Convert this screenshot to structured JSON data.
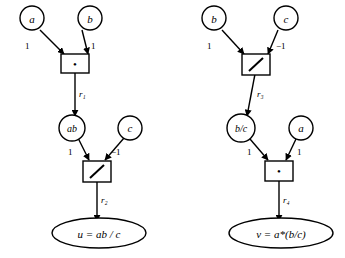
{
  "diagram": {
    "type": "computational-dataflow-graph",
    "title": "",
    "background_color": "#ffffff",
    "stroke_color": "#000000",
    "graphs": [
      {
        "id": "left-graph",
        "result": "u = ab / c",
        "nodes": [
          {
            "id": "a",
            "label": "a",
            "shape": "circle",
            "x": 30,
            "y": 18
          },
          {
            "id": "b",
            "label": "b",
            "shape": "circle",
            "x": 88,
            "y": 18
          },
          {
            "id": "mul1",
            "label": "•",
            "shape": "box",
            "x": 70,
            "y": 62
          },
          {
            "id": "ab",
            "label": "ab",
            "shape": "circle",
            "x": 70,
            "y": 128
          },
          {
            "id": "c1",
            "label": "c",
            "shape": "circle",
            "x": 128,
            "y": 128
          },
          {
            "id": "div1",
            "label": "/",
            "shape": "box",
            "x": 92,
            "y": 170
          },
          {
            "id": "u",
            "label": "u = ab / c",
            "shape": "ellipse",
            "x": 100,
            "y": 233
          }
        ],
        "edges": [
          {
            "from": "a",
            "to": "mul1",
            "weight": "1"
          },
          {
            "from": "b",
            "to": "mul1",
            "weight": "1"
          },
          {
            "from": "mul1",
            "to": "ab",
            "weight": "r₁"
          },
          {
            "from": "ab",
            "to": "div1",
            "weight": "1"
          },
          {
            "from": "c1",
            "to": "div1",
            "weight": "−1"
          },
          {
            "from": "div1",
            "to": "u",
            "weight": "r₂"
          }
        ]
      },
      {
        "id": "right-graph",
        "result": "v = a*(b/c)",
        "nodes": [
          {
            "id": "b2",
            "label": "b",
            "shape": "circle",
            "x": 213,
            "y": 18
          },
          {
            "id": "c2",
            "label": "c",
            "shape": "circle",
            "x": 282,
            "y": 18
          },
          {
            "id": "div2",
            "label": "/",
            "shape": "box",
            "x": 253,
            "y": 62
          },
          {
            "id": "bc",
            "label": "b/c",
            "shape": "circle",
            "x": 238,
            "y": 128
          },
          {
            "id": "a2",
            "label": "a",
            "shape": "circle",
            "x": 298,
            "y": 128
          },
          {
            "id": "mul2",
            "label": "•",
            "shape": "box",
            "x": 273,
            "y": 170
          },
          {
            "id": "v",
            "label": "v = a*(b/c)",
            "shape": "ellipse",
            "x": 283,
            "y": 233
          }
        ],
        "edges": [
          {
            "from": "b2",
            "to": "div2",
            "weight": "1"
          },
          {
            "from": "c2",
            "to": "div2",
            "weight": "−1"
          },
          {
            "from": "div2",
            "to": "bc",
            "weight": "r₃"
          },
          {
            "from": "bc",
            "to": "mul2",
            "weight": "1"
          },
          {
            "from": "a2",
            "to": "mul2",
            "weight": "1"
          },
          {
            "from": "mul2",
            "to": "v",
            "weight": "r₄"
          }
        ]
      }
    ],
    "labels": {
      "node_a_left": "a",
      "node_b_left": "b",
      "node_ab": "ab",
      "node_c_left": "c",
      "node_b_right": "b",
      "node_c_right": "c",
      "node_bc": "b/c",
      "node_a_right": "a",
      "op_multiply": "•",
      "op_divide": "/",
      "weight_one": "1",
      "weight_neg_one": "−1",
      "edge_r1": "r₁",
      "edge_r2": "r₂",
      "edge_r3": "r₃",
      "edge_r4": "r₄",
      "result_u": "u = ab / c",
      "result_v": "v = a*(b/c)"
    }
  }
}
